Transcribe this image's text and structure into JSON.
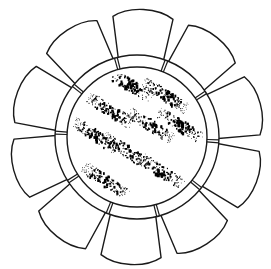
{
  "figure": {
    "background": "#ffffff",
    "stroke_color": "#1a1a1a",
    "fill_color": "#000000",
    "petal_count": 10,
    "ring_segment_marks": 10,
    "speckle_clusters": 9
  }
}
